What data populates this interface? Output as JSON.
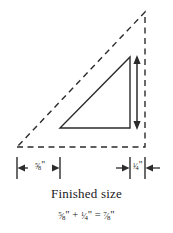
{
  "figure": {
    "title_text": "Finished size",
    "equation": {
      "left_operand": {
        "numerator": "5",
        "denominator": "8",
        "unit": "\""
      },
      "operator": "+",
      "right_operand": {
        "numerator": "1",
        "denominator": "4",
        "unit": "\""
      },
      "equals": "=",
      "result": {
        "numerator": "7",
        "denominator": "8",
        "unit": "\""
      }
    },
    "dimensions": [
      {
        "id": "finished-width",
        "numerator": "5",
        "denominator": "8",
        "unit": "\""
      },
      {
        "id": "seam-allowance",
        "numerator": "1",
        "denominator": "4",
        "unit": "\""
      }
    ],
    "colors": {
      "ink": "#1a1a1a",
      "background": "#ffffff",
      "solid_stroke": "#2b2b2b",
      "dashed_stroke": "#2b2b2b"
    },
    "shapes": {
      "cut_triangle": {
        "name": "cut-size-triangle",
        "style": "dashed",
        "points": "17,147 145,147 145,12"
      },
      "finished_triangle": {
        "name": "finished-size-triangle",
        "style": "solid",
        "points": "60,128 130,128 130,57"
      },
      "height_arrow": {
        "name": "height-dimension-arrow",
        "x": 137,
        "y_top": 57,
        "y_bottom": 128
      }
    }
  }
}
